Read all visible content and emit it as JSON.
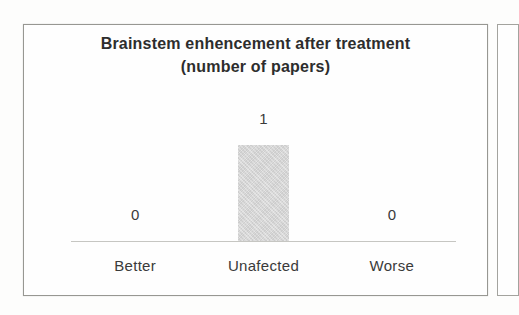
{
  "chart_data": {
    "type": "bar",
    "title": "Brainstem enhencement after treatment",
    "subtitle": "(number of papers)",
    "categories": [
      "Better",
      "Unafected",
      "Worse"
    ],
    "values": [
      0,
      1,
      0
    ],
    "data_labels": [
      "0",
      "1",
      "0"
    ],
    "xlabel": "",
    "ylabel": "",
    "ylim": [
      0,
      1
    ],
    "y_axis_visible": false,
    "gridlines": false,
    "legend": "none",
    "bar_color": "#d9d9d9",
    "axis_line_color": "#c6c6c2",
    "text_color": "#303030",
    "frame_border_color": "#979792"
  }
}
